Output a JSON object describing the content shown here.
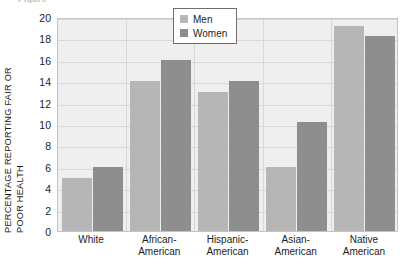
{
  "figure": {
    "caption_sliver": "Figure",
    "ylabel_line1": "PERCENTAGE REPORTING FAIR OR",
    "ylabel_line2": "POOR HEALTH"
  },
  "legend": {
    "items": [
      {
        "label": "Men",
        "color": "#b6b6b6",
        "swatch_name": "legend-swatch-men"
      },
      {
        "label": "Women",
        "color": "#8e8e8e",
        "swatch_name": "legend-swatch-women"
      }
    ]
  },
  "axis": {
    "yticks": [
      "0",
      "2",
      "4",
      "6",
      "8",
      "10",
      "12",
      "14",
      "16",
      "18",
      "20"
    ],
    "ymin": 0,
    "ymax": 20,
    "ystep": 2
  },
  "chart_data": {
    "type": "bar",
    "title": "",
    "xlabel": "",
    "ylabel": "PERCENTAGE REPORTING FAIR OR POOR HEALTH",
    "ylim": [
      0,
      20
    ],
    "ytick_step": 2,
    "grid": true,
    "legend_position": "top-center",
    "categories": [
      "White",
      "African-American",
      "Hispanic-American",
      "Asian-American",
      "Native American"
    ],
    "category_lines": [
      [
        "White"
      ],
      [
        "African-",
        "American"
      ],
      [
        "Hispanic-",
        "American"
      ],
      [
        "Asian-",
        "American"
      ],
      [
        "Native",
        "American"
      ]
    ],
    "series": [
      {
        "name": "Men",
        "color": "#b6b6b6",
        "values": [
          5,
          14,
          13,
          6,
          19.2
        ]
      },
      {
        "name": "Women",
        "color": "#8e8e8e",
        "values": [
          6,
          16,
          14,
          10.2,
          18.2
        ]
      }
    ]
  }
}
